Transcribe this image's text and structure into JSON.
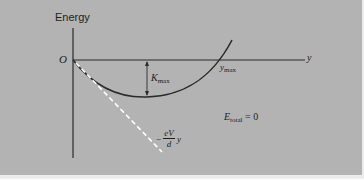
{
  "diagram": {
    "y_axis_label": "Energy",
    "origin_label": "O",
    "x_axis_label": "y",
    "kmax_label": "K",
    "kmax_sub": "max",
    "ymax_label": "y",
    "ymax_sub": "max",
    "total_energy_label": "E",
    "total_energy_sub": "total",
    "total_energy_value": "= 0",
    "potential_sign": "−",
    "potential_num": "eV",
    "potential_den": "d",
    "potential_var": "y",
    "colors": {
      "background": "#b3b3b3",
      "lines": "#2a2a2a",
      "potential_line": "#ffffff"
    }
  }
}
